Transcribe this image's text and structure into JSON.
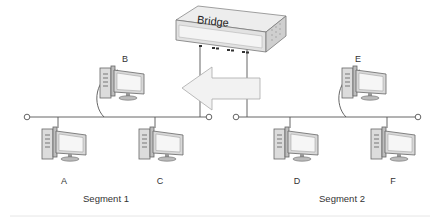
{
  "bridge": {
    "label": "Bridge"
  },
  "computers": [
    {
      "id": "A",
      "label": "A"
    },
    {
      "id": "B",
      "label": "B"
    },
    {
      "id": "C",
      "label": "C"
    },
    {
      "id": "D",
      "label": "D"
    },
    {
      "id": "E",
      "label": "E"
    },
    {
      "id": "F",
      "label": "F"
    }
  ],
  "segments": [
    {
      "label": "Segment 1"
    },
    {
      "label": "Segment 2"
    }
  ],
  "arrow": {
    "direction": "left"
  },
  "colors": {
    "line": "#555555",
    "device_fill": "#e8e8e8",
    "screen": "#f4f4f4",
    "arrow_fill": "#f2f2f2"
  }
}
